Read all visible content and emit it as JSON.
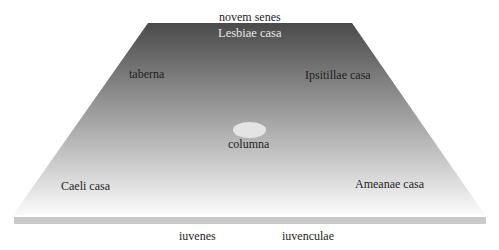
{
  "diagram": {
    "type": "stage-plan",
    "colors": {
      "floor_top": "#4a4a4a",
      "floor_bottom": "#fbfbfb",
      "front_strip": "#c9c9c9",
      "column": "#e4e4e4"
    },
    "labels": {
      "back_offstage": "novem senes",
      "back_center": "Lesbiae casa",
      "back_left": "taberna",
      "back_right": "Ipsitillae casa",
      "center": "columna",
      "front_left": "Caeli casa",
      "front_right": "Ameanae casa",
      "audience_left": "iuvenes",
      "audience_right": "iuvenculae"
    }
  }
}
